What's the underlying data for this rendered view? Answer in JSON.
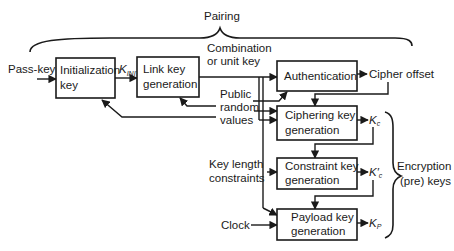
{
  "title": "Pairing",
  "inputs": {
    "pass_key": "Pass-key",
    "public_random_line1": "Public",
    "public_random_line2": "random",
    "public_random_line3": "values",
    "key_length_line1": "Key length",
    "key_length_line2": "constraints",
    "clock": "Clock"
  },
  "intermediates": {
    "combination_line1": "Combination",
    "combination_line2": "or unit key",
    "k_init": "K",
    "k_init_sub": "INIT",
    "cipher_offset": "Cipher offset"
  },
  "boxes": {
    "init_line1": "Initialization",
    "init_line2": "key",
    "link_line1": "Link key",
    "link_line2": "generation",
    "auth_line1": "Authentication",
    "ciph_line1": "Ciphering key",
    "ciph_line2": "generation",
    "constr_line1": "Constraint key",
    "constr_line2": "generation",
    "payload_line1": "Payload key",
    "payload_line2": "generation"
  },
  "outputs": {
    "kc": "K",
    "kc_sub": "c",
    "kc_prime": "K′",
    "kc_prime_sub": "c",
    "kp": "K",
    "kp_sub": "P",
    "group_line1": "Encryption",
    "group_line2": "(pre) keys"
  }
}
